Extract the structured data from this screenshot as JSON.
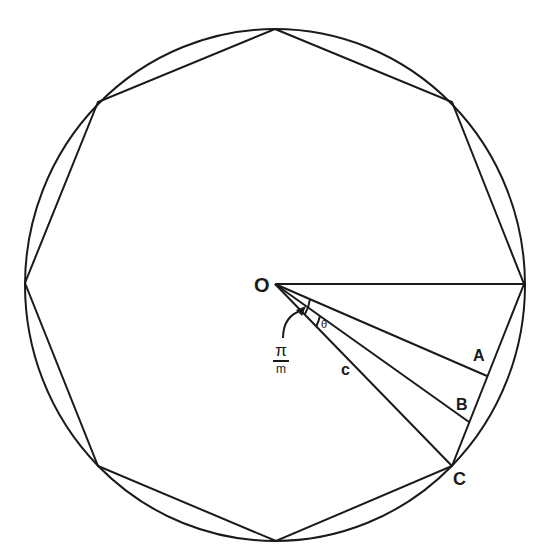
{
  "diagram": {
    "type": "inscribed-octagon-geometry",
    "center_label": "O",
    "point_labels": [
      "A",
      "B",
      "C"
    ],
    "segment_label": "c",
    "angle_label": "θ",
    "fraction_label": {
      "numerator": "π",
      "denominator": "m"
    },
    "stroke_color": "#1a1a1a",
    "background_color": "#ffffff"
  }
}
